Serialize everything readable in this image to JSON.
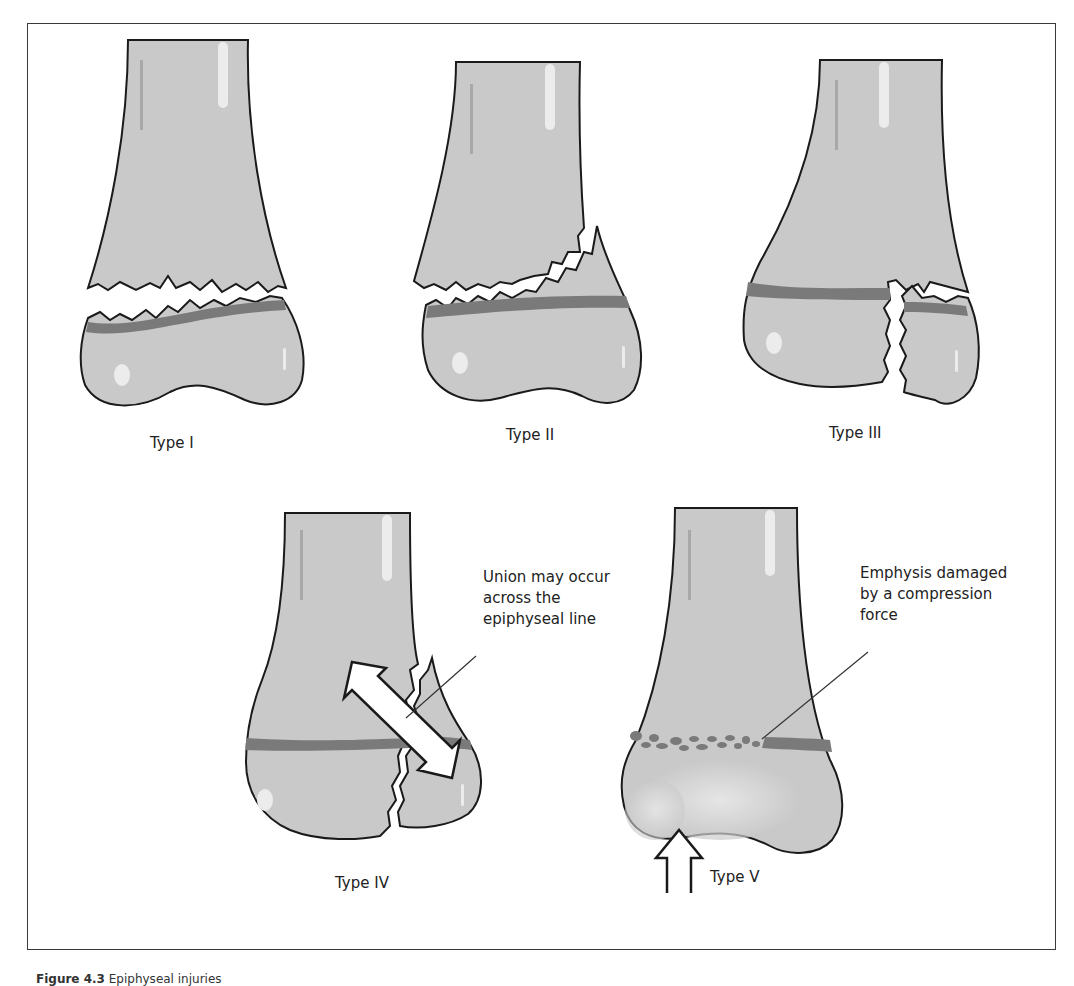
{
  "figure": {
    "caption_number": "Figure 4.3",
    "caption_text": "Epiphyseal injuries"
  },
  "colors": {
    "bone_fill": "#c9c9c9",
    "bone_outline": "#1a1a1a",
    "growth_plate": "#7a7a7a",
    "highlight": "#ececec",
    "background": "#ffffff"
  },
  "panels": [
    {
      "id": "type-1",
      "label": "Type I",
      "description": "Fracture through the growth plate separating epiphysis from metaphysis"
    },
    {
      "id": "type-2",
      "label": "Type II",
      "description": "Fracture through growth plate extending up into the metaphysis"
    },
    {
      "id": "type-3",
      "label": "Type III",
      "description": "Fracture through growth plate extending down through the epiphysis"
    },
    {
      "id": "type-4",
      "label": "Type IV",
      "description": "Fracture crossing metaphysis, growth plate and epiphysis",
      "annotation": "Union may occur across the epiphyseal line"
    },
    {
      "id": "type-5",
      "label": "Type V",
      "description": "Crush injury of the growth plate",
      "annotation": "Emphysis damaged by a compression force"
    }
  ]
}
